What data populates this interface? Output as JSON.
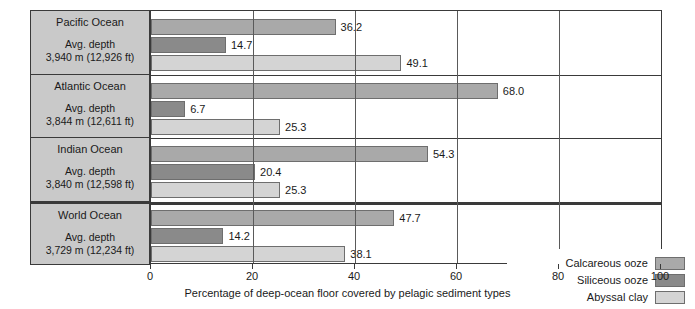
{
  "chart_data": {
    "type": "bar",
    "orientation": "horizontal",
    "title": "",
    "xlabel": "Percentage of deep-ocean floor covered by pelagic sediment types",
    "ylabel": "",
    "xlim": [
      0,
      100
    ],
    "xticks": [
      0,
      20,
      40,
      60,
      80,
      100
    ],
    "grid": true,
    "legend_position": "bottom-right",
    "categories": [
      "Pacific Ocean",
      "Atlantic Ocean",
      "Indian Ocean",
      "World Ocean"
    ],
    "series": [
      {
        "name": "Calcareous ooze",
        "color": "#a9a9a9",
        "values": [
          36.2,
          68.0,
          54.3,
          47.7
        ]
      },
      {
        "name": "Siliceous ooze",
        "color": "#8a8a8a",
        "values": [
          14.7,
          6.7,
          20.4,
          14.2
        ]
      },
      {
        "name": "Abyssal clay",
        "color": "#d4d4d4",
        "values": [
          49.1,
          25.3,
          25.3,
          38.1
        ]
      }
    ],
    "rows": [
      {
        "ocean": "Pacific Ocean",
        "depth_caption": "Avg. depth",
        "depth_value": "3,940 m (12,926 ft)",
        "calcareous_ooze": 36.2,
        "siliceous_ooze": 14.7,
        "abyssal_clay": 49.1
      },
      {
        "ocean": "Atlantic Ocean",
        "depth_caption": "Avg. depth",
        "depth_value": "3,844 m (12,611 ft)",
        "calcareous_ooze": 68.0,
        "siliceous_ooze": 6.7,
        "abyssal_clay": 25.3
      },
      {
        "ocean": "Indian Ocean",
        "depth_caption": "Avg. depth",
        "depth_value": "3,840 m (12,598 ft)",
        "calcareous_ooze": 54.3,
        "siliceous_ooze": 20.4,
        "abyssal_clay": 25.3
      },
      {
        "ocean": "World Ocean",
        "depth_caption": "Avg. depth",
        "depth_value": "3,729 m (12,234 ft)",
        "calcareous_ooze": 47.7,
        "siliceous_ooze": 14.2,
        "abyssal_clay": 38.1
      }
    ]
  },
  "axis": {
    "tick_labels": [
      "0",
      "20",
      "40",
      "60",
      "80",
      "100"
    ],
    "title": "Percentage of deep-ocean floor covered by pelagic sediment types"
  },
  "value_labels": {
    "pacific": {
      "calcareous": "36.2",
      "siliceous": "14.7",
      "abyssal": "49.1"
    },
    "atlantic": {
      "calcareous": "68.0",
      "siliceous": "6.7",
      "abyssal": "25.3"
    },
    "indian": {
      "calcareous": "54.3",
      "siliceous": "20.4",
      "abyssal": "25.3"
    },
    "world": {
      "calcareous": "47.7",
      "siliceous": "14.2",
      "abyssal": "38.1"
    }
  },
  "legend": {
    "items": [
      {
        "label": "Calcareous ooze",
        "color": "#a9a9a9"
      },
      {
        "label": "Siliceous ooze",
        "color": "#8a8a8a"
      },
      {
        "label": "Abyssal clay",
        "color": "#d4d4d4"
      }
    ]
  }
}
